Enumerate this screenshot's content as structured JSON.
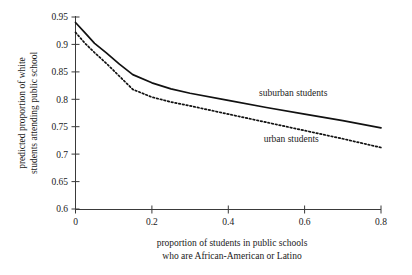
{
  "chart_data": {
    "type": "line",
    "title": "",
    "xlabel": "proportion of students in public schools who are African-American or Latino",
    "xlabel_line1": "proportion of students in public schools",
    "xlabel_line2": "who are African-American or Latino",
    "ylabel": "predicted proportion of white students attending public school",
    "ylabel_line1": "predicted proportion of white",
    "ylabel_line2": "students attending public school",
    "xlim": [
      0,
      0.8
    ],
    "ylim": [
      0.6,
      0.95
    ],
    "xticks": [
      0,
      0.2,
      0.4,
      0.6,
      0.8
    ],
    "xtick_labels": [
      "0",
      "0.2",
      "0.4",
      "0.6",
      "0.8"
    ],
    "yticks": [
      0.6,
      0.65,
      0.7,
      0.75,
      0.8,
      0.85,
      0.9,
      0.95
    ],
    "ytick_labels": [
      "0.6",
      "0.65",
      "0.7",
      "0.75",
      "0.8",
      "0.85",
      "0.9",
      "0.95"
    ],
    "grid": false,
    "legend_position": "inline-annotations",
    "series": [
      {
        "name": "suburban students",
        "style": "solid",
        "color": "#111111",
        "x": [
          0.0,
          0.025,
          0.05,
          0.08,
          0.115,
          0.15,
          0.2,
          0.25,
          0.3,
          0.4,
          0.5,
          0.6,
          0.7,
          0.8
        ],
        "values": [
          0.94,
          0.921,
          0.902,
          0.885,
          0.864,
          0.845,
          0.83,
          0.819,
          0.811,
          0.798,
          0.785,
          0.773,
          0.761,
          0.748
        ]
      },
      {
        "name": "urban students",
        "style": "dotted",
        "color": "#111111",
        "x": [
          0.0,
          0.025,
          0.05,
          0.08,
          0.115,
          0.15,
          0.2,
          0.25,
          0.3,
          0.4,
          0.5,
          0.6,
          0.7,
          0.8
        ],
        "values": [
          0.922,
          0.902,
          0.885,
          0.866,
          0.842,
          0.818,
          0.804,
          0.795,
          0.788,
          0.773,
          0.758,
          0.743,
          0.728,
          0.712
        ]
      }
    ],
    "annotations": [
      {
        "text": "suburban students",
        "x": 0.57,
        "y": 0.806,
        "anchor": "middle"
      },
      {
        "text": "urban students",
        "x": 0.565,
        "y": 0.723,
        "anchor": "middle"
      }
    ]
  }
}
